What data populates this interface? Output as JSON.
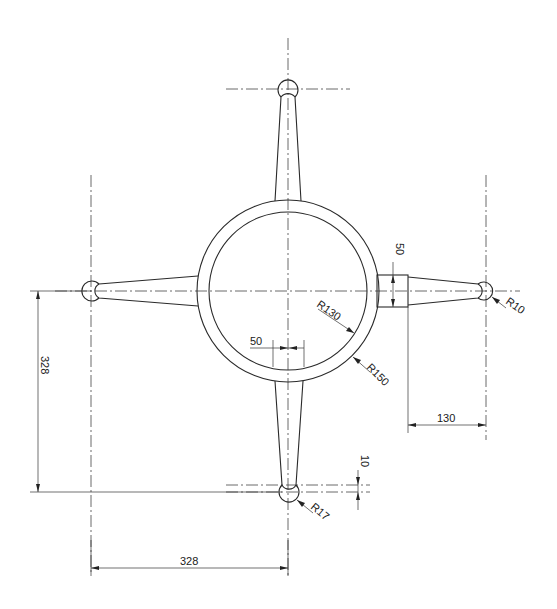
{
  "drawing": {
    "type": "technical-drawing",
    "subject": "four-arm ring handwheel",
    "colors": {
      "line": "#2a2a2a",
      "background": "#ffffff"
    }
  },
  "dimensions": {
    "boss_width": "50",
    "hub_offset_width": "50",
    "inner_radius": "R130",
    "outer_radius": "R150",
    "right_ball_radius": "R10",
    "bottom_ball_radius": "R17",
    "right_arm_length": "130",
    "vertical_offset": "10",
    "vertical_span": "328",
    "horizontal_span": "328"
  }
}
